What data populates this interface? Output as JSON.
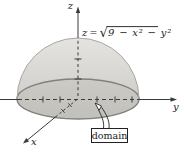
{
  "figure": {
    "equation": {
      "lhs": "z",
      "rel": "=",
      "radical_sign": "√",
      "radicand": "9 − x² − y²"
    },
    "axes": {
      "z_label": "z",
      "y_label": "y",
      "x_label": "x"
    },
    "callout_label": "domain",
    "colors": {
      "background": "#ffffff",
      "dome_top": "#e4e3e0",
      "dome_bottom": "#c7c6c1",
      "disk_tint": "#aeada6",
      "rim_stroke": "#82817c",
      "dome_edge": "#a8a7a2",
      "axis_stroke": "#3b3b3b",
      "text": "#1a1a1a"
    }
  }
}
